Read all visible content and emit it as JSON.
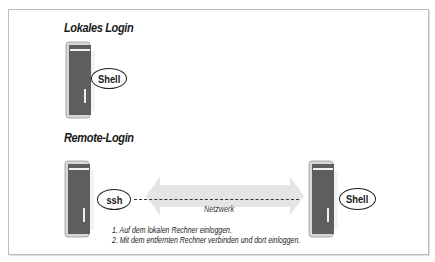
{
  "diagram": {
    "local_section": {
      "title": "Lokales Login",
      "computer_icon": "tower-computer-icon",
      "bubble_label": "Shell"
    },
    "remote_section": {
      "title": "Remote-Login",
      "local_computer_icon": "tower-computer-icon",
      "local_bubble_label": "ssh",
      "network_label": "Netzwerk",
      "remote_computer_icon": "tower-computer-icon",
      "remote_bubble_label": "Shell",
      "steps": [
        "1. Auf dem lokalen Rechner einloggen.",
        "2. Mit dem entfernten Rechner verbinden und dort einloggen."
      ]
    },
    "colors": {
      "frame_border": "#bdbdbd",
      "tower_body": "#5a5a5a",
      "arrow_fill": "#e4e4e4",
      "text": "#1a1a1a"
    }
  }
}
